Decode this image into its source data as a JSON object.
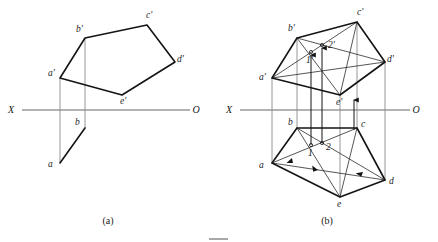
{
  "figure": {
    "captions": [
      {
        "id": "caption-a",
        "text": "(a)",
        "x": 108,
        "y": 224
      },
      {
        "id": "caption-b",
        "text": "(b)",
        "x": 327,
        "y": 224
      }
    ],
    "axis_labels": {
      "x_label": "X",
      "o_label": "O"
    },
    "colors": {
      "heavy_line": "#141414",
      "thin_line": "#2b2b2b",
      "projection_line": "#8a8a8a",
      "axis_line": "#555555",
      "text": "#1a1a1a",
      "background": "#ffffff"
    }
  },
  "panel_a": {
    "name": "(a)",
    "axis": {
      "x1": 22,
      "y1": 110,
      "x2": 190,
      "y2": 110,
      "x_label": "X",
      "x_label_x": 11,
      "x_label_y": 113,
      "o_label": "O",
      "o_label_x": 196,
      "o_label_y": 113
    },
    "front_view": {
      "points": [
        {
          "id": "a-prime",
          "label": "a'",
          "x": 60,
          "y": 78,
          "lx": 48,
          "ly": 76
        },
        {
          "id": "b-prime",
          "label": "b'",
          "x": 85,
          "y": 38,
          "lx": 76,
          "ly": 32
        },
        {
          "id": "c-prime",
          "label": "c'",
          "x": 147,
          "y": 25,
          "lx": 146,
          "ly": 18
        },
        {
          "id": "d-prime",
          "label": "d'",
          "x": 175,
          "y": 62,
          "lx": 177,
          "ly": 62
        },
        {
          "id": "e-prime",
          "label": "e'",
          "x": 122,
          "y": 95,
          "lx": 120,
          "ly": 104
        }
      ],
      "polygon": "60,78 85,38 147,25 175,62 122,95"
    },
    "top_view": {
      "points": [
        {
          "id": "a",
          "label": "a",
          "x": 60,
          "y": 163,
          "lx": 48,
          "ly": 167
        },
        {
          "id": "b",
          "label": "b",
          "x": 85,
          "y": 128,
          "lx": 75,
          "ly": 125
        }
      ],
      "edge": "60,163 85,128"
    },
    "projectors": [
      {
        "id": "projector-a",
        "x1": 60,
        "y1": 78,
        "x2": 60,
        "y2": 163
      },
      {
        "id": "projector-b",
        "x1": 85,
        "y1": 38,
        "x2": 85,
        "y2": 128
      }
    ]
  },
  "panel_b": {
    "name": "(b)",
    "axis": {
      "x1": 240,
      "y1": 110,
      "x2": 410,
      "y2": 110,
      "x_label": "X",
      "x_label_x": 229,
      "x_label_y": 113,
      "o_label": "O",
      "o_label_x": 416,
      "o_label_y": 113
    },
    "front_view": {
      "points": [
        {
          "id": "a-prime",
          "label": "a'",
          "x": 272,
          "y": 78,
          "lx": 259,
          "ly": 77
        },
        {
          "id": "b-prime",
          "label": "b'",
          "x": 297,
          "y": 38,
          "lx": 288,
          "ly": 31
        },
        {
          "id": "c-prime",
          "label": "c'",
          "x": 357,
          "y": 22,
          "lx": 357,
          "ly": 15
        },
        {
          "id": "d-prime",
          "label": "d'",
          "x": 385,
          "y": 62,
          "lx": 387,
          "ly": 62
        },
        {
          "id": "e-prime",
          "label": "e'",
          "x": 340,
          "y": 95,
          "lx": 338,
          "ly": 104
        }
      ],
      "polygon": "272,78 297,38 357,22 385,62 340,95"
    },
    "top_view": {
      "points": [
        {
          "id": "a",
          "label": "a",
          "x": 272,
          "y": 163,
          "lx": 259,
          "ly": 167
        },
        {
          "id": "b",
          "label": "b",
          "x": 297,
          "y": 128,
          "lx": 288,
          "ly": 125
        },
        {
          "id": "c",
          "label": "c",
          "x": 357,
          "y": 128,
          "lx": 361,
          "ly": 127
        },
        {
          "id": "d",
          "label": "d",
          "x": 385,
          "y": 180,
          "lx": 389,
          "ly": 183
        },
        {
          "id": "e",
          "label": "e",
          "x": 340,
          "y": 197,
          "lx": 338,
          "ly": 206
        }
      ],
      "polygon": "272,163 297,128 357,128 385,180 340,197"
    },
    "auxiliary_points": {
      "front": [
        {
          "id": "one-prime",
          "label": "1'",
          "x": 311,
          "y": 52,
          "lx": 308,
          "ly": 62
        },
        {
          "id": "two-prime",
          "label": "2'",
          "x": 322,
          "y": 45,
          "lx": 329,
          "ly": 48
        }
      ],
      "top": [
        {
          "id": "one",
          "label": "1",
          "x": 311,
          "y": 145,
          "lx": 310,
          "ly": 156
        },
        {
          "id": "two",
          "label": "2",
          "x": 322,
          "y": 143,
          "lx": 327,
          "ly": 150
        }
      ]
    },
    "construction_lines_front": [
      {
        "id": "bp-to-ep",
        "x1": 297,
        "y1": 38,
        "x2": 340,
        "y2": 95
      },
      {
        "id": "ap-to-cp",
        "x1": 272,
        "y1": 78,
        "x2": 357,
        "y2": 22
      },
      {
        "id": "ap-to-dp",
        "x1": 272,
        "y1": 78,
        "x2": 385,
        "y2": 62
      },
      {
        "id": "bp-to-dp",
        "x1": 297,
        "y1": 38,
        "x2": 385,
        "y2": 62
      },
      {
        "id": "cp-to-ep",
        "x1": 357,
        "y1": 22,
        "x2": 340,
        "y2": 95
      }
    ],
    "construction_lines_top": [
      {
        "id": "b-to-e",
        "x1": 297,
        "y1": 128,
        "x2": 340,
        "y2": 197
      },
      {
        "id": "a-to-c",
        "x1": 272,
        "y1": 163,
        "x2": 357,
        "y2": 128
      },
      {
        "id": "a-to-d",
        "x1": 272,
        "y1": 163,
        "x2": 385,
        "y2": 180
      },
      {
        "id": "b-to-d",
        "x1": 297,
        "y1": 128,
        "x2": 385,
        "y2": 180
      },
      {
        "id": "c-to-e",
        "x1": 357,
        "y1": 128,
        "x2": 340,
        "y2": 197
      }
    ],
    "projectors": [
      {
        "id": "projector-a",
        "x1": 272,
        "y1": 78,
        "x2": 272,
        "y2": 163
      },
      {
        "id": "projector-b",
        "x1": 297,
        "y1": 38,
        "x2": 297,
        "y2": 128
      },
      {
        "id": "projector-c",
        "x1": 357,
        "y1": 22,
        "x2": 357,
        "y2": 128
      },
      {
        "id": "projector-d",
        "x1": 385,
        "y1": 62,
        "x2": 385,
        "y2": 180
      },
      {
        "id": "projector-e",
        "x1": 340,
        "y1": 95,
        "x2": 340,
        "y2": 197
      }
    ],
    "transfer_arrows": [
      {
        "id": "arrow-1",
        "x": 311,
        "y_from": 145,
        "y_to": 52
      },
      {
        "id": "arrow-2",
        "x": 322,
        "y_from": 143,
        "y_to": 45
      },
      {
        "id": "arrow-e",
        "x": 354,
        "y_from": 130,
        "y_to": 97
      }
    ],
    "direction_arrows": [
      {
        "id": "dir-a-c",
        "x": 292,
        "y": 158,
        "angle": -22
      },
      {
        "id": "dir-b-e",
        "x": 318,
        "y": 170,
        "angle": 58
      },
      {
        "id": "dir-a-d",
        "x": 363,
        "y": 172,
        "angle": 9
      }
    ]
  },
  "footer": {
    "rule_visible": true
  }
}
